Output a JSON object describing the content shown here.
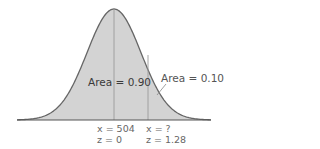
{
  "chart_data": {
    "type": "area",
    "title": "",
    "mean_x": 504,
    "annotations": [
      {
        "label": "Area = 0.90",
        "region": "left of z = 1.28"
      },
      {
        "label": "Area = 0.10",
        "region": "right tail beyond z = 1.28"
      }
    ],
    "markers": [
      {
        "x_label": "x = 504",
        "z_label": "z = 0",
        "z": 0
      },
      {
        "x_label": "x = ?",
        "z_label": "z = 1.28",
        "z": 1.28
      }
    ],
    "colors": {
      "fill": "#d3d3d3",
      "curve": "#666666",
      "marker_line": "#9a9a9a",
      "axis": "#555555"
    },
    "grid": false,
    "legend": null
  },
  "labels": {
    "area_main": "Area = 0.90",
    "area_tail": "Area = 0.10",
    "m0_x": "x = 504",
    "m0_z": "z = 0",
    "m1_x": "x = ?",
    "m1_z": "z = 1.28"
  }
}
